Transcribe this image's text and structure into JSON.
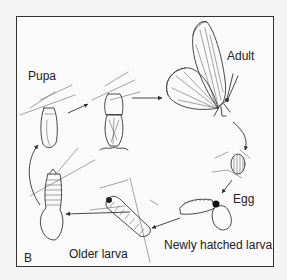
{
  "figure": {
    "panel_label": "B",
    "stages": [
      {
        "id": "adult",
        "label": "Adult"
      },
      {
        "id": "egg",
        "label": "Egg"
      },
      {
        "id": "newly_hatched_larva",
        "label": "Newly hatched larva"
      },
      {
        "id": "older_larva",
        "label": "Older larva"
      },
      {
        "id": "pupa",
        "label": "Pupa"
      }
    ],
    "cycle_order": [
      "Egg",
      "Newly hatched larva",
      "Older larva",
      "Pupa",
      "Adult"
    ]
  }
}
